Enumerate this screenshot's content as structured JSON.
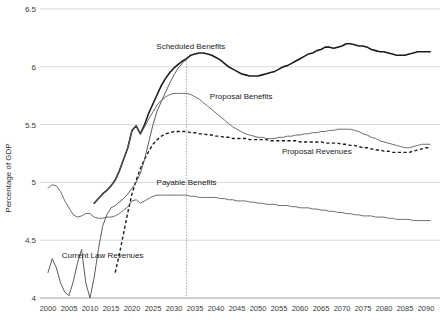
{
  "chart_data": {
    "type": "line",
    "title": "",
    "xlabel": "",
    "ylabel": "Percentage of GDP",
    "xlim": [
      2000,
      2092
    ],
    "ylim": [
      4,
      6.5
    ],
    "grid": true,
    "legend_position": "inline-annotations",
    "x_ticks": [
      2000,
      2005,
      2010,
      2015,
      2020,
      2025,
      2030,
      2035,
      2040,
      2045,
      2050,
      2055,
      2060,
      2065,
      2070,
      2075,
      2080,
      2085,
      2090
    ],
    "y_ticks": [
      4,
      4.5,
      5,
      5.5,
      6,
      6.5
    ],
    "annotations": [
      {
        "name": "scheduled-benefits-label",
        "text": "Scheduled Benefits",
        "x": 2034,
        "y": 6.15
      },
      {
        "name": "proposal-benefits-label",
        "text": "Proposal Benefits",
        "x": 2046,
        "y": 5.72
      },
      {
        "name": "proposal-revenues-label",
        "text": "Proposal Revenues",
        "x": 2064,
        "y": 5.25
      },
      {
        "name": "payable-benefits-label",
        "text": "Payable Benefits",
        "x": 2033,
        "y": 4.98
      },
      {
        "name": "current-law-revenues-label",
        "text": "Current Law Revenues",
        "x": 2013,
        "y": 4.35
      }
    ],
    "vertical_marker": {
      "name": "trust-fund-exhaustion-marker",
      "x": 2033,
      "style": "dotted"
    },
    "series": [
      {
        "name": "Scheduled Benefits",
        "style": "solid-thick-black",
        "color": "#1c1c1c",
        "x": [
          2011,
          2012,
          2013,
          2014,
          2015,
          2016,
          2017,
          2018,
          2019,
          2020,
          2021,
          2022,
          2023,
          2024,
          2025,
          2026,
          2027,
          2028,
          2029,
          2030,
          2031,
          2032,
          2033,
          2034,
          2035,
          2036,
          2037,
          2038,
          2039,
          2040,
          2041,
          2042,
          2043,
          2044,
          2045,
          2046,
          2047,
          2048,
          2049,
          2050,
          2051,
          2052,
          2053,
          2054,
          2055,
          2056,
          2057,
          2058,
          2059,
          2060,
          2061,
          2062,
          2063,
          2064,
          2065,
          2066,
          2067,
          2068,
          2069,
          2070,
          2071,
          2072,
          2073,
          2074,
          2075,
          2076,
          2077,
          2078,
          2079,
          2080,
          2081,
          2082,
          2083,
          2084,
          2085,
          2086,
          2087,
          2088,
          2089,
          2090,
          2091
        ],
        "values": [
          4.82,
          4.86,
          4.9,
          4.93,
          4.97,
          5.02,
          5.1,
          5.2,
          5.3,
          5.45,
          5.49,
          5.42,
          5.5,
          5.6,
          5.68,
          5.76,
          5.84,
          5.9,
          5.95,
          5.99,
          6.02,
          6.05,
          6.07,
          6.1,
          6.11,
          6.12,
          6.12,
          6.11,
          6.1,
          6.08,
          6.06,
          6.03,
          6.0,
          5.98,
          5.96,
          5.94,
          5.93,
          5.92,
          5.92,
          5.92,
          5.93,
          5.94,
          5.95,
          5.96,
          5.98,
          6.0,
          6.01,
          6.03,
          6.05,
          6.07,
          6.09,
          6.11,
          6.12,
          6.14,
          6.15,
          6.17,
          6.17,
          6.16,
          6.17,
          6.18,
          6.2,
          6.2,
          6.19,
          6.18,
          6.18,
          6.17,
          6.15,
          6.14,
          6.13,
          6.13,
          6.12,
          6.11,
          6.1,
          6.1,
          6.1,
          6.11,
          6.12,
          6.13,
          6.13,
          6.13,
          6.13
        ]
      },
      {
        "name": "Proposal Benefits",
        "style": "solid-thin-gray",
        "color": "#5e5e5e",
        "x": [
          2011,
          2012,
          2013,
          2014,
          2015,
          2016,
          2017,
          2018,
          2019,
          2020,
          2021,
          2022,
          2023,
          2024,
          2025,
          2026,
          2027,
          2028,
          2029,
          2030,
          2031,
          2032,
          2033,
          2034,
          2035,
          2036,
          2037,
          2038,
          2039,
          2040,
          2041,
          2042,
          2043,
          2044,
          2045,
          2046,
          2047,
          2048,
          2049,
          2050,
          2051,
          2052,
          2053,
          2054,
          2055,
          2056,
          2057,
          2058,
          2059,
          2060,
          2061,
          2062,
          2063,
          2064,
          2065,
          2066,
          2067,
          2068,
          2069,
          2070,
          2071,
          2072,
          2073,
          2074,
          2075,
          2076,
          2077,
          2078,
          2079,
          2080,
          2081,
          2082,
          2083,
          2084,
          2085,
          2086,
          2087,
          2088,
          2089,
          2090,
          2091
        ],
        "values": [
          4.82,
          4.86,
          4.9,
          4.93,
          4.97,
          5.02,
          5.1,
          5.2,
          5.3,
          5.45,
          5.49,
          5.42,
          5.48,
          5.55,
          5.61,
          5.67,
          5.71,
          5.74,
          5.76,
          5.77,
          5.77,
          5.77,
          5.77,
          5.76,
          5.74,
          5.72,
          5.69,
          5.66,
          5.63,
          5.6,
          5.57,
          5.54,
          5.51,
          5.48,
          5.46,
          5.44,
          5.42,
          5.41,
          5.4,
          5.39,
          5.39,
          5.38,
          5.38,
          5.38,
          5.39,
          5.39,
          5.4,
          5.4,
          5.41,
          5.41,
          5.42,
          5.42,
          5.43,
          5.43,
          5.44,
          5.44,
          5.45,
          5.45,
          5.46,
          5.46,
          5.46,
          5.46,
          5.45,
          5.44,
          5.42,
          5.41,
          5.39,
          5.38,
          5.36,
          5.35,
          5.34,
          5.33,
          5.32,
          5.31,
          5.3,
          5.3,
          5.31,
          5.32,
          5.33,
          5.33,
          5.33
        ]
      },
      {
        "name": "Proposal Revenues",
        "style": "dashed-black",
        "color": "#1c1c1c",
        "x": [
          2016,
          2017,
          2018,
          2019,
          2020,
          2021,
          2022,
          2023,
          2024,
          2025,
          2026,
          2027,
          2028,
          2029,
          2030,
          2031,
          2032,
          2033,
          2034,
          2035,
          2036,
          2037,
          2038,
          2039,
          2040,
          2041,
          2042,
          2043,
          2044,
          2045,
          2046,
          2047,
          2048,
          2049,
          2050,
          2051,
          2052,
          2053,
          2054,
          2055,
          2056,
          2057,
          2058,
          2059,
          2060,
          2061,
          2062,
          2063,
          2064,
          2065,
          2066,
          2067,
          2068,
          2069,
          2070,
          2071,
          2072,
          2073,
          2074,
          2075,
          2076,
          2077,
          2078,
          2079,
          2080,
          2081,
          2082,
          2083,
          2084,
          2085,
          2086,
          2087,
          2088,
          2089,
          2090,
          2091
        ],
        "values": [
          4.22,
          4.38,
          4.56,
          4.74,
          4.9,
          5.02,
          5.12,
          5.2,
          5.27,
          5.33,
          5.37,
          5.4,
          5.42,
          5.43,
          5.44,
          5.44,
          5.44,
          5.44,
          5.43,
          5.43,
          5.42,
          5.42,
          5.41,
          5.41,
          5.4,
          5.4,
          5.39,
          5.39,
          5.38,
          5.38,
          5.38,
          5.38,
          5.37,
          5.37,
          5.37,
          5.37,
          5.37,
          5.36,
          5.36,
          5.36,
          5.36,
          5.36,
          5.36,
          5.36,
          5.35,
          5.35,
          5.35,
          5.35,
          5.35,
          5.35,
          5.34,
          5.34,
          5.34,
          5.34,
          5.33,
          5.33,
          5.32,
          5.32,
          5.31,
          5.3,
          5.3,
          5.29,
          5.28,
          5.28,
          5.27,
          5.27,
          5.26,
          5.26,
          5.26,
          5.26,
          5.26,
          5.27,
          5.28,
          5.29,
          5.3,
          5.3
        ]
      },
      {
        "name": "Payable Benefits",
        "style": "solid-thin-gray",
        "color": "#5e5e5e",
        "x": [
          2000,
          2001,
          2002,
          2003,
          2004,
          2005,
          2006,
          2007,
          2008,
          2009,
          2010,
          2011,
          2012,
          2013,
          2014,
          2015,
          2016,
          2017,
          2018,
          2019,
          2020,
          2021,
          2022,
          2023,
          2024,
          2025,
          2026,
          2027,
          2028,
          2029,
          2030,
          2031,
          2032,
          2033,
          2034,
          2035,
          2036,
          2037,
          2038,
          2039,
          2040,
          2041,
          2042,
          2043,
          2044,
          2045,
          2046,
          2047,
          2048,
          2049,
          2050,
          2051,
          2052,
          2053,
          2054,
          2055,
          2056,
          2057,
          2058,
          2059,
          2060,
          2061,
          2062,
          2063,
          2064,
          2065,
          2066,
          2067,
          2068,
          2069,
          2070,
          2071,
          2072,
          2073,
          2074,
          2075,
          2076,
          2077,
          2078,
          2079,
          2080,
          2081,
          2082,
          2083,
          2084,
          2085,
          2086,
          2087,
          2088,
          2089,
          2090,
          2091
        ],
        "values": [
          4.95,
          4.98,
          4.97,
          4.92,
          4.84,
          4.78,
          4.72,
          4.7,
          4.71,
          4.73,
          4.73,
          4.7,
          4.69,
          4.69,
          4.7,
          4.7,
          4.71,
          4.73,
          4.76,
          4.79,
          4.84,
          4.85,
          4.82,
          4.84,
          4.86,
          4.88,
          4.89,
          4.89,
          4.89,
          4.89,
          4.89,
          4.89,
          4.89,
          4.89,
          4.88,
          4.88,
          4.87,
          4.87,
          4.87,
          4.87,
          4.87,
          4.86,
          4.86,
          4.85,
          4.85,
          4.84,
          4.84,
          4.84,
          4.83,
          4.83,
          4.82,
          4.82,
          4.81,
          4.81,
          4.81,
          4.8,
          4.8,
          4.8,
          4.79,
          4.79,
          4.78,
          4.78,
          4.78,
          4.77,
          4.77,
          4.76,
          4.76,
          4.75,
          4.75,
          4.74,
          4.74,
          4.73,
          4.73,
          4.72,
          4.72,
          4.71,
          4.71,
          4.71,
          4.7,
          4.7,
          4.7,
          4.69,
          4.69,
          4.68,
          4.68,
          4.68,
          4.68,
          4.67,
          4.67,
          4.67,
          4.67,
          4.67
        ]
      },
      {
        "name": "Current Law Revenues",
        "style": "solid-thin-gray",
        "color": "#4a4a4a",
        "x": [
          2000,
          2001,
          2002,
          2003,
          2004,
          2005,
          2006,
          2007,
          2008,
          2009,
          2010,
          2011,
          2012,
          2013,
          2014,
          2015,
          2016,
          2017,
          2018,
          2019,
          2020,
          2021,
          2022,
          2023,
          2024,
          2025,
          2026,
          2027,
          2028,
          2029,
          2030,
          2031,
          2032,
          2033
        ],
        "values": [
          4.22,
          4.34,
          4.26,
          4.13,
          4.05,
          4.02,
          4.14,
          4.3,
          4.42,
          4.13,
          4.0,
          4.18,
          4.42,
          4.62,
          4.72,
          4.78,
          4.8,
          4.83,
          4.86,
          4.9,
          4.95,
          5.0,
          5.08,
          5.2,
          5.35,
          5.5,
          5.62,
          5.7,
          5.78,
          5.86,
          5.93,
          5.99,
          6.03,
          6.07
        ]
      }
    ]
  },
  "axis": {
    "y_label": "Percentage of GDP"
  }
}
